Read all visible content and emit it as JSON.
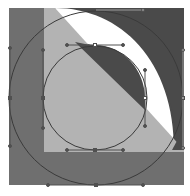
{
  "figure": {
    "colors": {
      "background": "#ffffff",
      "dark_fill": "#4a4a4a",
      "mid_fill": "#6f6f6f",
      "light_fill": "#b3b3b3",
      "white_fill": "#ffffff",
      "path_stroke": "#3a3a3a",
      "handle_stroke": "#505050"
    },
    "frame": {
      "x": 9,
      "y": 8,
      "width": 175,
      "height": 177
    },
    "circles": [
      {
        "name": "outer-circle-path",
        "cx": 96,
        "cy": 98,
        "r": 87
      },
      {
        "name": "inner-circle-path",
        "cx": 95,
        "cy": 98,
        "r": 52
      }
    ],
    "anchors": [
      {
        "name": "inner-top-anchor",
        "x": 95,
        "y": 45,
        "h1": [
          67,
          45
        ],
        "h2": [
          123,
          45
        ]
      },
      {
        "name": "inner-left-anchor",
        "x": 43,
        "y": 98,
        "h1": [
          43,
          50
        ],
        "h2": [
          43,
          128
        ]
      },
      {
        "name": "inner-right-anchor",
        "x": 145,
        "y": 98,
        "h1": [
          145,
          70
        ],
        "h2": [
          145,
          126
        ]
      },
      {
        "name": "inner-bottom-anchor",
        "x": 95,
        "y": 150,
        "h1": [
          67,
          150
        ],
        "h2": [
          123,
          150
        ]
      },
      {
        "name": "outer-bottom-anchor",
        "x": 96,
        "y": 185,
        "h1": [
          48,
          185
        ],
        "h2": [
          143,
          185
        ]
      },
      {
        "name": "outer-left-anchor",
        "x": 10,
        "y": 98,
        "h1": [
          10,
          48
        ],
        "h2": [
          10,
          146
        ]
      },
      {
        "name": "outer-right-anchor",
        "x": 183,
        "y": 98,
        "h1": [
          183,
          50
        ],
        "h2": [
          183,
          148
        ]
      },
      {
        "name": "outer-top-anchor",
        "x": 96,
        "y": 10,
        "h1": [
          48,
          10
        ],
        "h2": [
          143,
          10
        ]
      }
    ]
  }
}
